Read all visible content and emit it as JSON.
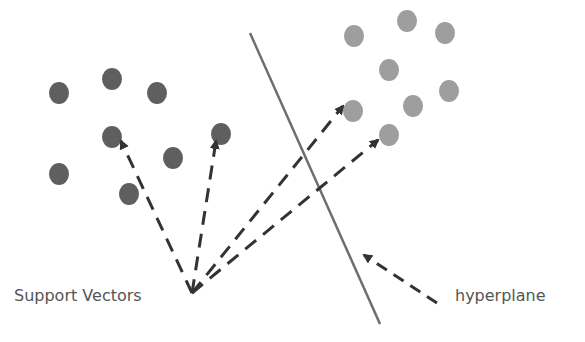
{
  "labels": {
    "support_vectors": "Support Vectors",
    "hyperplane": "hyperplane"
  },
  "colors": {
    "class_a": "#5f5f5f",
    "class_b": "#9e9e9e",
    "line": "#6e6e6e",
    "arrow": "#333333",
    "text": "#555555"
  },
  "class_a_points": [
    [
      59,
      93
    ],
    [
      112,
      79
    ],
    [
      157,
      93
    ],
    [
      112,
      137
    ],
    [
      221,
      134
    ],
    [
      173,
      158
    ],
    [
      59,
      174
    ],
    [
      129,
      194
    ]
  ],
  "class_b_points": [
    [
      354,
      36
    ],
    [
      407,
      21
    ],
    [
      445,
      33
    ],
    [
      389,
      70
    ],
    [
      449,
      91
    ],
    [
      353,
      111
    ],
    [
      413,
      106
    ],
    [
      389,
      135
    ]
  ],
  "hyperplane_line": [
    [
      250,
      33
    ],
    [
      380,
      324
    ]
  ],
  "origin": [
    192,
    293
  ],
  "support_vector_arrows": [
    [
      121,
      141
    ],
    [
      216,
      141
    ],
    [
      343,
      106
    ],
    [
      378,
      140
    ]
  ],
  "hyperplane_arrow": {
    "from": [
      437,
      303
    ],
    "to": [
      364,
      255
    ]
  },
  "point_radius_x": 10,
  "point_radius_y": 11
}
